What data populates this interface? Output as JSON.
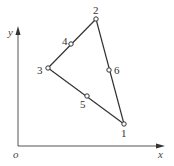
{
  "diagram": {
    "type": "six-node triangular element",
    "colors": {
      "line": "#333333",
      "axis": "#444444",
      "node_fill": "#ffffff"
    },
    "axes": {
      "origin_label": "o",
      "x_label": "x",
      "y_label": "y"
    },
    "nodes": [
      {
        "id": "1",
        "label": "1",
        "x": 124,
        "y": 124
      },
      {
        "id": "2",
        "label": "2",
        "x": 96,
        "y": 19
      },
      {
        "id": "3",
        "label": "3",
        "x": 48,
        "y": 68
      },
      {
        "id": "4",
        "label": "4",
        "x": 71,
        "y": 44
      },
      {
        "id": "5",
        "label": "5",
        "x": 87,
        "y": 96
      },
      {
        "id": "6",
        "label": "6",
        "x": 109,
        "y": 70
      }
    ],
    "edges": [
      {
        "from": "1",
        "to": "2",
        "midnode": "6"
      },
      {
        "from": "2",
        "to": "3",
        "midnode": "4"
      },
      {
        "from": "3",
        "to": "1",
        "midnode": "5"
      }
    ]
  }
}
